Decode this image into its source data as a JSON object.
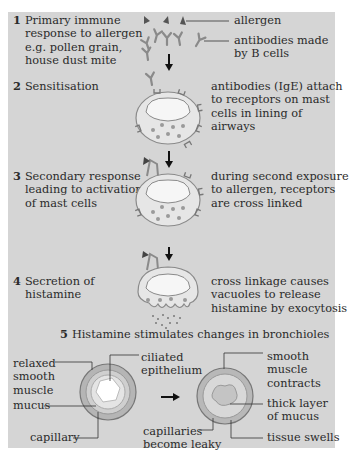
{
  "steps": [
    {
      "number": "1",
      "lines": [
        "Primary immune",
        "response to allergen",
        "e.g. pollen grain,",
        "house dust mite"
      ]
    },
    {
      "number": "2",
      "lines": [
        "Sensitisation"
      ]
    },
    {
      "number": "3",
      "lines": [
        "Secondary response",
        "leading to activation",
        "of mast cells"
      ]
    },
    {
      "number": "4",
      "lines": [
        "Secretion of",
        "histamine"
      ]
    },
    {
      "number": "5",
      "lines": [
        "Histamine stimulates changes in bronchioles"
      ]
    }
  ],
  "labels": {
    "allergen": "allergen",
    "antibodies": [
      "antibodies made",
      "by B cells"
    ],
    "step2_desc": [
      "antibodies (IgE) attach",
      "to receptors on mast",
      "cells in lining of",
      "airways"
    ],
    "step3_desc": [
      "during second exposure",
      "to allergen, receptors",
      "are cross linked"
    ],
    "step4_desc": [
      "cross linkage causes",
      "vacuoles to release",
      "histamine by exocytosis"
    ]
  },
  "bronchiole_normal": {
    "relaxed_muscle": [
      "relaxed",
      "smooth",
      "muscle"
    ],
    "ciliated": [
      "ciliated",
      "epithelium"
    ],
    "mucus": "mucus",
    "capillary": "capillary"
  },
  "bronchiole_asthma": {
    "smooth_muscle": [
      "smooth",
      "muscle",
      "contracts"
    ],
    "thick_mucus": [
      "thick layer",
      "of mucus"
    ],
    "capillaries": [
      "capillaries",
      "become leaky"
    ],
    "tissue": "tissue swells"
  },
  "colors": {
    "panel": "#d5d5d5",
    "cell_fill": "#f4f4f4",
    "cell_outline": "#8a8a8a",
    "text": "#2a2a2a"
  }
}
